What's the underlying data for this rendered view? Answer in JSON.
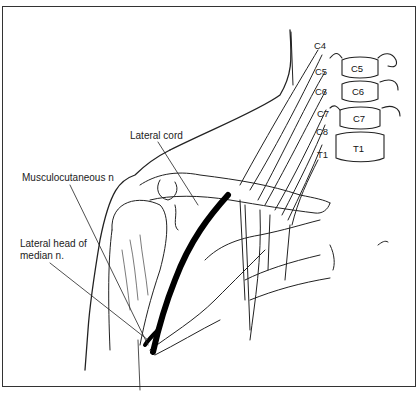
{
  "figure": {
    "labels": {
      "lateral_cord": "Lateral cord",
      "musculocutaneous": "Musculocutaneous n",
      "lateral_head_line1": "Lateral head of",
      "lateral_head_line2": "median n."
    },
    "nerve_roots": [
      "C4",
      "C5",
      "C6",
      "C7",
      "C8",
      "T1"
    ],
    "vertebrae": [
      "C5",
      "C6",
      "C7",
      "T1"
    ],
    "colors": {
      "ink": "#222222",
      "highlight_nerve": "#000000",
      "background": "#ffffff"
    }
  }
}
